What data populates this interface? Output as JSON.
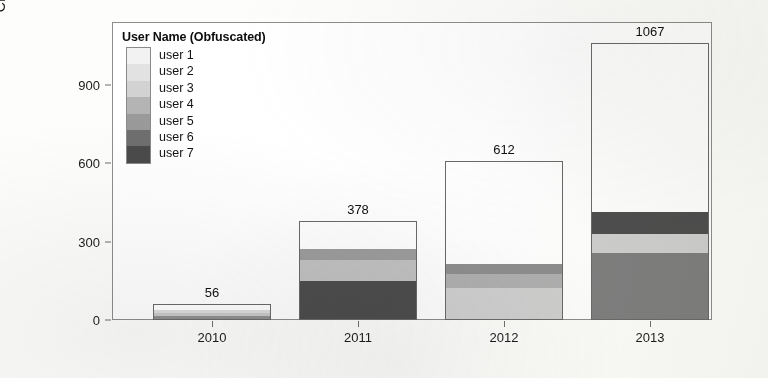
{
  "chart_data": {
    "type": "bar",
    "title": "",
    "xlabel": "",
    "ylabel": "CPU Time (Years)",
    "categories": [
      "2010",
      "2011",
      "2012",
      "2013"
    ],
    "ylim": [
      0,
      1150
    ],
    "yticks": [
      0,
      300,
      600,
      900
    ],
    "ytick_labels": [
      "0",
      "300",
      "600",
      "900"
    ],
    "grid": false,
    "stacked": true,
    "legend_title": "User Name (Obfuscated)",
    "legend_position": "top-left inside plot",
    "bar_totals": [
      56,
      378,
      612,
      1067
    ],
    "bar_total_labels": [
      "56",
      "378",
      "612",
      "1067"
    ],
    "series": [
      {
        "name": "user 1",
        "color": "#f2f2f2",
        "values": [
          4,
          8,
          14,
          22
        ]
      },
      {
        "name": "user 2",
        "color": "#e2e2e2",
        "values": [
          6,
          10,
          18,
          28
        ]
      },
      {
        "name": "user 3",
        "color": "#d2d2d2",
        "values": [
          34,
          22,
          120,
          75
        ]
      },
      {
        "name": "user 4",
        "color": "#b4b4b4",
        "values": [
          5,
          28,
          55,
          30
        ]
      },
      {
        "name": "user 5",
        "color": "#9a9a9a",
        "values": [
          4,
          80,
          35,
          255
        ]
      },
      {
        "name": "user 6",
        "color": "#6e6e6e",
        "values": [
          2,
          80,
          20,
          85
        ]
      },
      {
        "name": "user 7",
        "color": "#4a4a4a",
        "values": [
          1,
          150,
          10,
          72
        ]
      }
    ],
    "unallocated_note": "white remainder above stacked segments in each bar"
  },
  "legend": {
    "title": "User Name (Obfuscated)",
    "items": [
      {
        "label": "user 1",
        "color": "#f2f2f2"
      },
      {
        "label": "user 2",
        "color": "#e2e2e2"
      },
      {
        "label": "user 3",
        "color": "#d2d2d2"
      },
      {
        "label": "user 4",
        "color": "#b4b4b4"
      },
      {
        "label": "user 5",
        "color": "#9a9a9a"
      },
      {
        "label": "user 6",
        "color": "#6e6e6e"
      },
      {
        "label": "user 7",
        "color": "#4a4a4a"
      }
    ]
  },
  "axes": {
    "y_title": "CPU Time (Years)",
    "y_labels": [
      "900",
      "600",
      "300",
      "0"
    ],
    "x_labels": [
      "2010",
      "2011",
      "2012",
      "2013"
    ]
  },
  "bars_render": [
    {
      "category": "2010",
      "total_label": "56",
      "left": 40,
      "width": 118,
      "top_px": 304,
      "height_px": 16,
      "segments": [
        {
          "name": "user 7",
          "color": "#8f8f8f",
          "h": 3
        },
        {
          "name": "user 6",
          "color": "#c9c9c9",
          "h": 4
        },
        {
          "name": "user 3",
          "color": "#dcdcdc",
          "h": 3
        },
        {
          "name": "white-remainder",
          "color": "#ffffff",
          "h": 6
        }
      ]
    },
    {
      "category": "2011",
      "total_label": "378",
      "left": 186,
      "width": 118,
      "top_px": 221,
      "height_px": 99,
      "segments": [
        {
          "name": "user 7",
          "color": "#4d4d4d",
          "h": 39
        },
        {
          "name": "user 5",
          "color": "#c2c2c2",
          "h": 21
        },
        {
          "name": "user 4",
          "color": "#9d9d9d",
          "h": 11
        },
        {
          "name": "white-remainder",
          "color": "#ffffff",
          "h": 28
        }
      ]
    },
    {
      "category": "2012",
      "total_label": "612",
      "left": 332,
      "width": 118,
      "top_px": 161,
      "height_px": 159,
      "segments": [
        {
          "name": "user 3",
          "color": "#d0d0d0",
          "h": 31
        },
        {
          "name": "user 4",
          "color": "#b0b0b0",
          "h": 15
        },
        {
          "name": "user 5",
          "color": "#8e8e8e",
          "h": 10
        },
        {
          "name": "white-remainder",
          "color": "#ffffff",
          "h": 103
        }
      ]
    },
    {
      "category": "2013",
      "total_label": "1067",
      "left": 478,
      "width": 118,
      "top_px": 43,
      "height_px": 277,
      "segments": [
        {
          "name": "user 5",
          "color": "#7f7f7f",
          "h": 66
        },
        {
          "name": "user 3",
          "color": "#cfcfcf",
          "h": 20
        },
        {
          "name": "user 7",
          "color": "#4f4f4f",
          "h": 22
        },
        {
          "name": "white-remainder",
          "color": "#ffffff",
          "h": 169
        }
      ]
    }
  ],
  "yticks_render": [
    {
      "label": "900",
      "y": 85
    },
    {
      "label": "600",
      "y": 163
    },
    {
      "label": "300",
      "y": 242
    },
    {
      "label": "0",
      "y": 320
    }
  ],
  "xticks_render": [
    {
      "label": "2010",
      "x": 212
    },
    {
      "label": "2011",
      "x": 358
    },
    {
      "label": "2012",
      "x": 504
    },
    {
      "label": "2013",
      "x": 650
    }
  ]
}
